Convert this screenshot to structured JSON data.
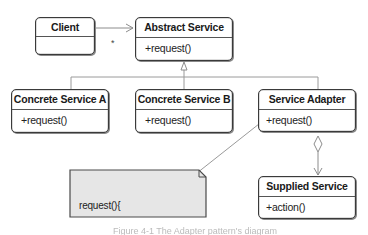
{
  "diagram": {
    "type": "UML class diagram (Adapter pattern)",
    "classes": [
      {
        "id": "client",
        "name": "Client",
        "operations": []
      },
      {
        "id": "abstract_service",
        "name": "Abstract Service",
        "operations": [
          "+request()"
        ]
      },
      {
        "id": "concrete_service_a",
        "name": "Concrete Service A",
        "operations": [
          "+request()"
        ]
      },
      {
        "id": "concrete_service_b",
        "name": "Concrete Service B",
        "operations": [
          "+request()"
        ]
      },
      {
        "id": "service_adapter",
        "name": "Service Adapter",
        "operations": [
          "+request()"
        ]
      },
      {
        "id": "supplied_service",
        "name": "Supplied Service",
        "operations": [
          "+action()"
        ]
      }
    ],
    "relations": [
      {
        "from": "client",
        "to": "abstract_service",
        "type": "association",
        "multiplicity": "*"
      },
      {
        "from": "concrete_service_a",
        "to": "abstract_service",
        "type": "generalization"
      },
      {
        "from": "concrete_service_b",
        "to": "abstract_service",
        "type": "generalization"
      },
      {
        "from": "service_adapter",
        "to": "abstract_service",
        "type": "generalization"
      },
      {
        "from": "service_adapter",
        "to": "supplied_service",
        "type": "aggregation"
      }
    ],
    "note": {
      "attached_to": "service_adapter.request",
      "line1": "request(){",
      "line2": "  mySuppliedService.action();",
      "line3": "}"
    },
    "caption": "Figure 4-1 The Adapter pattern's diagram"
  },
  "colors": {
    "line": "#8c8c8c",
    "box_border": "#3a3a3a",
    "note_fill": "#e6e6e6"
  }
}
